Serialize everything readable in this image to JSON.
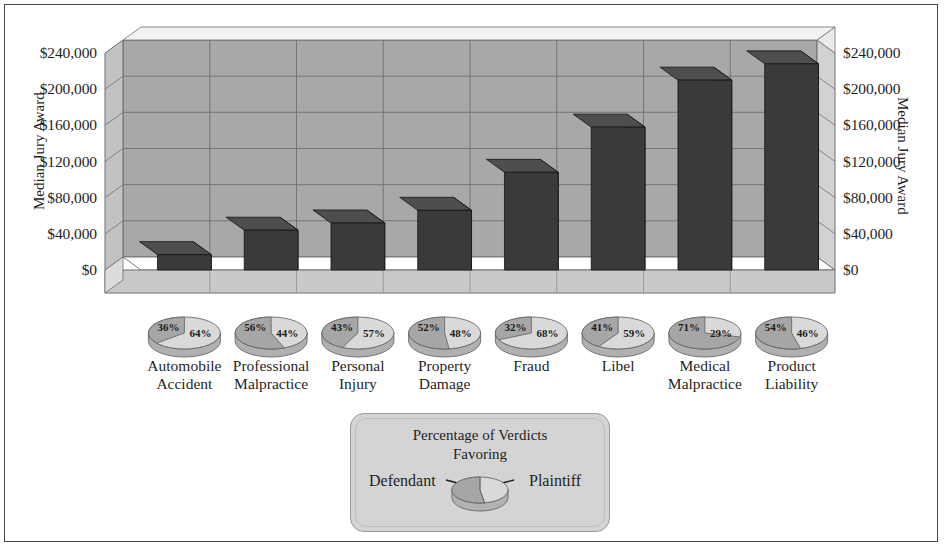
{
  "chart_data": {
    "type": "bar",
    "title": "",
    "xlabel": "",
    "ylabel": "Median Jury Award",
    "ylim": [
      0,
      240000
    ],
    "yticks": [
      "$0",
      "$40,000",
      "$80,000",
      "$120,000",
      "$160,000",
      "$200,000",
      "$240,000"
    ],
    "ytick_values": [
      0,
      40000,
      80000,
      120000,
      160000,
      200000,
      240000
    ],
    "grid": true,
    "legend_position": "bottom-center",
    "categories": [
      "Automobile Accident",
      "Professional Malpractice",
      "Personal Injury",
      "Property Damage",
      "Fraud",
      "Libel",
      "Medical Malpractice",
      "Product Liability"
    ],
    "values": [
      17000,
      44000,
      52000,
      66000,
      108000,
      158000,
      210000,
      228000
    ],
    "series": [
      {
        "name": "Median Jury Award",
        "values": [
          17000,
          44000,
          52000,
          66000,
          108000,
          158000,
          210000,
          228000
        ]
      }
    ],
    "pies": [
      {
        "category": "Automobile Accident",
        "defendant": "36%",
        "plaintiff": "64%",
        "defendant_pct": 36,
        "plaintiff_pct": 64
      },
      {
        "category": "Professional Malpractice",
        "defendant": "56%",
        "plaintiff": "44%",
        "defendant_pct": 56,
        "plaintiff_pct": 44
      },
      {
        "category": "Personal Injury",
        "defendant": "43%",
        "plaintiff": "57%",
        "defendant_pct": 43,
        "plaintiff_pct": 57
      },
      {
        "category": "Property Damage",
        "defendant": "52%",
        "plaintiff": "48%",
        "defendant_pct": 52,
        "plaintiff_pct": 48
      },
      {
        "category": "Fraud",
        "defendant": "32%",
        "plaintiff": "68%",
        "defendant_pct": 32,
        "plaintiff_pct": 68
      },
      {
        "category": "Libel",
        "defendant": "41%",
        "plaintiff": "59%",
        "defendant_pct": 41,
        "plaintiff_pct": 59
      },
      {
        "category": "Medical Malpractice",
        "defendant": "71%",
        "plaintiff": "29%",
        "defendant_pct": 71,
        "plaintiff_pct": 29
      },
      {
        "category": "Product Liability",
        "defendant": "54%",
        "plaintiff": "46%",
        "defendant_pct": 54,
        "plaintiff_pct": 46
      }
    ]
  },
  "axes": {
    "left_title": "Median Jury Award",
    "right_title": "Median Jury Award",
    "ticks": [
      "$240,000",
      "$200,000",
      "$160,000",
      "$120,000",
      "$80,000",
      "$40,000",
      "$0"
    ]
  },
  "categories": [
    {
      "line1": "Automobile",
      "line2": "Accident"
    },
    {
      "line1": "Professional",
      "line2": "Malpractice"
    },
    {
      "line1": "Personal",
      "line2": "Injury"
    },
    {
      "line1": "Property",
      "line2": "Damage"
    },
    {
      "line1": "Fraud",
      "line2": ""
    },
    {
      "line1": "Libel",
      "line2": ""
    },
    {
      "line1": "Medical",
      "line2": "Malpractice"
    },
    {
      "line1": "Product",
      "line2": "Liability"
    }
  ],
  "pie_labels": [
    {
      "left": "36%",
      "right": "64%"
    },
    {
      "left": "56%",
      "right": "44%"
    },
    {
      "left": "43%",
      "right": "57%"
    },
    {
      "left": "52%",
      "right": "48%"
    },
    {
      "left": "32%",
      "right": "68%"
    },
    {
      "left": "41%",
      "right": "59%"
    },
    {
      "left": "71%",
      "right": "29%"
    },
    {
      "left": "54%",
      "right": "46%"
    }
  ],
  "legend": {
    "title_line1": "Percentage of Verdicts",
    "title_line2": "Favoring",
    "left_label": "Defendant",
    "right_label": "Plaintiff"
  },
  "colors": {
    "bar_front": "#3a3a3a",
    "bar_top": "#4e4e4e",
    "bar_side": "#2b2b2b",
    "wall": "#a8a8a8",
    "wall_side": "#9b9b9b",
    "floor": "#c9c9c9",
    "floor_front": "#bcbcbc",
    "pie_defendant": "#a6a6a6",
    "pie_plaintiff": "#d9d9d9",
    "legend_bg": "#d4d4d4",
    "border": "#4a4a4a"
  }
}
